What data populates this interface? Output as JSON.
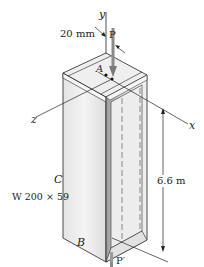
{
  "diagram": {
    "type": "engineering-figure",
    "labels": {
      "y_axis": "y",
      "x_axis": "x",
      "z_axis": "z",
      "load_top": "P",
      "load_bottom": "P′",
      "point_a": "A",
      "point_b": "B",
      "point_c": "C",
      "eccentricity": "20 mm",
      "length": "6.6 m",
      "section": "W 200 × 59"
    },
    "colors": {
      "line": "#222222",
      "face_left": "#e9e9e9",
      "face_top": "#efefef",
      "face_inner": "#cfcfcf",
      "load_arrow": "#8a8a8a"
    }
  }
}
